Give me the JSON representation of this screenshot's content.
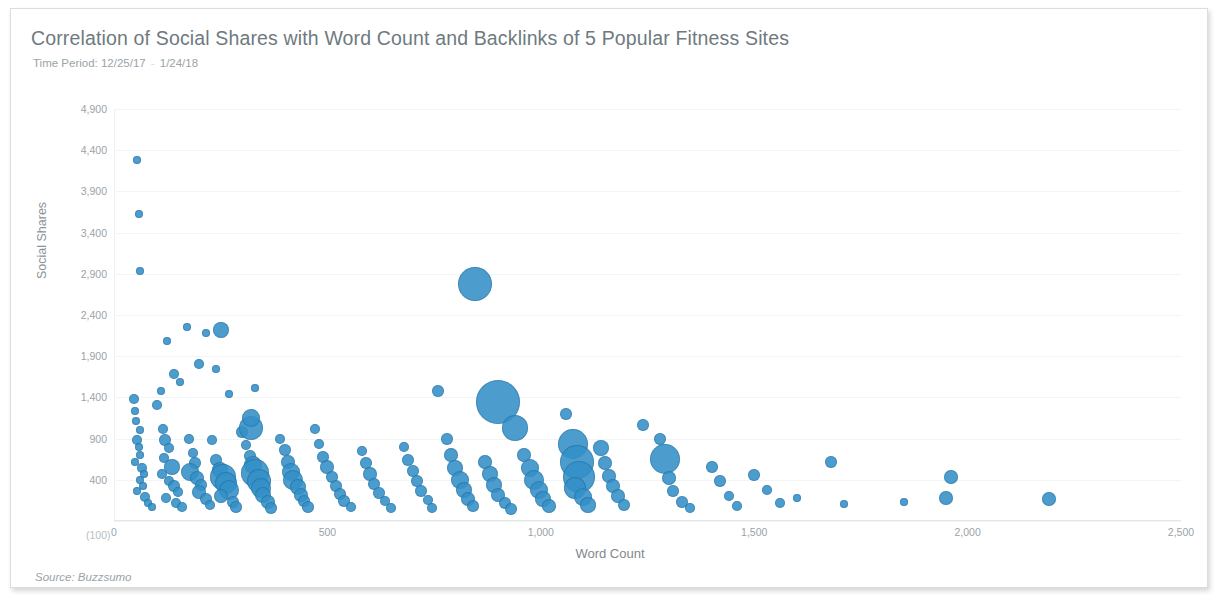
{
  "header": {
    "title": "Correlation of Social Shares with Word Count and Backlinks of 5 Popular Fitness Sites",
    "subtitle_prefix": "Time Period:",
    "start_date": "12/25/17",
    "end_date": "1/24/18",
    "separator": "-"
  },
  "footer": {
    "source": "Source: Buzzsumo"
  },
  "style": {
    "bubble_color": "#3490c8",
    "title_color": "#6e7a80",
    "label_color": "#9aa3a8",
    "grid_color": "#f2f4f5",
    "border_color": "#dddddd"
  },
  "chart_data": {
    "type": "scatter",
    "title": "Correlation of Social Shares with Word Count and Backlinks of 5 Popular Fitness Sites",
    "subtitle": "Time Period: 12/25/17 - 1/24/18",
    "xlabel": "Word Count",
    "ylabel": "Social Shares",
    "source": "Source: Buzzsumo",
    "grid": true,
    "legend": "none",
    "bubble_size_encodes": "Backlinks",
    "xlim": [
      0,
      2500
    ],
    "ylim": [
      -100,
      4900
    ],
    "xticks": [
      0,
      500,
      1000,
      1500,
      2000,
      2500
    ],
    "xtick_labels": [
      "0",
      "500",
      "1,000",
      "1,500",
      "2,000",
      "2,500"
    ],
    "yticks": [
      -100,
      400,
      900,
      1400,
      1900,
      2400,
      2900,
      3400,
      3900,
      4400,
      4900
    ],
    "ytick_labels": [
      "(100)",
      "400",
      "900",
      "1,400",
      "1,900",
      "2,400",
      "2,900",
      "3,400",
      "3,900",
      "4,400",
      "4,900"
    ],
    "points": [
      {
        "x": 55,
        "y": 4280,
        "r": 4
      },
      {
        "x": 58,
        "y": 3620,
        "r": 4
      },
      {
        "x": 60,
        "y": 2930,
        "r": 4
      },
      {
        "x": 48,
        "y": 1380,
        "r": 5
      },
      {
        "x": 50,
        "y": 1230,
        "r": 4
      },
      {
        "x": 52,
        "y": 1110,
        "r": 4
      },
      {
        "x": 60,
        "y": 1000,
        "r": 4
      },
      {
        "x": 55,
        "y": 880,
        "r": 5
      },
      {
        "x": 58,
        "y": 800,
        "r": 4
      },
      {
        "x": 62,
        "y": 700,
        "r": 4
      },
      {
        "x": 50,
        "y": 620,
        "r": 4
      },
      {
        "x": 65,
        "y": 540,
        "r": 5
      },
      {
        "x": 70,
        "y": 470,
        "r": 4
      },
      {
        "x": 60,
        "y": 400,
        "r": 4
      },
      {
        "x": 68,
        "y": 330,
        "r": 4
      },
      {
        "x": 55,
        "y": 260,
        "r": 4
      },
      {
        "x": 72,
        "y": 190,
        "r": 5
      },
      {
        "x": 80,
        "y": 120,
        "r": 4
      },
      {
        "x": 90,
        "y": 70,
        "r": 4
      },
      {
        "x": 100,
        "y": 1310,
        "r": 5
      },
      {
        "x": 110,
        "y": 1480,
        "r": 4
      },
      {
        "x": 125,
        "y": 2090,
        "r": 4
      },
      {
        "x": 140,
        "y": 1680,
        "r": 5
      },
      {
        "x": 155,
        "y": 1590,
        "r": 4
      },
      {
        "x": 170,
        "y": 2260,
        "r": 4
      },
      {
        "x": 200,
        "y": 1810,
        "r": 5
      },
      {
        "x": 215,
        "y": 2180,
        "r": 4
      },
      {
        "x": 240,
        "y": 1740,
        "r": 4
      },
      {
        "x": 250,
        "y": 2220,
        "r": 8
      },
      {
        "x": 270,
        "y": 1440,
        "r": 4
      },
      {
        "x": 330,
        "y": 1520,
        "r": 4
      },
      {
        "x": 115,
        "y": 1020,
        "r": 5
      },
      {
        "x": 120,
        "y": 880,
        "r": 6
      },
      {
        "x": 130,
        "y": 780,
        "r": 5
      },
      {
        "x": 118,
        "y": 660,
        "r": 5
      },
      {
        "x": 135,
        "y": 560,
        "r": 8
      },
      {
        "x": 112,
        "y": 470,
        "r": 5
      },
      {
        "x": 128,
        "y": 390,
        "r": 5
      },
      {
        "x": 140,
        "y": 320,
        "r": 6
      },
      {
        "x": 150,
        "y": 250,
        "r": 5
      },
      {
        "x": 122,
        "y": 180,
        "r": 5
      },
      {
        "x": 145,
        "y": 120,
        "r": 5
      },
      {
        "x": 160,
        "y": 70,
        "r": 5
      },
      {
        "x": 175,
        "y": 900,
        "r": 5
      },
      {
        "x": 185,
        "y": 720,
        "r": 5
      },
      {
        "x": 190,
        "y": 600,
        "r": 6
      },
      {
        "x": 178,
        "y": 500,
        "r": 9
      },
      {
        "x": 195,
        "y": 420,
        "r": 7
      },
      {
        "x": 205,
        "y": 340,
        "r": 6
      },
      {
        "x": 200,
        "y": 250,
        "r": 7
      },
      {
        "x": 215,
        "y": 170,
        "r": 6
      },
      {
        "x": 225,
        "y": 90,
        "r": 5
      },
      {
        "x": 230,
        "y": 880,
        "r": 5
      },
      {
        "x": 240,
        "y": 640,
        "r": 6
      },
      {
        "x": 248,
        "y": 520,
        "r": 8
      },
      {
        "x": 255,
        "y": 440,
        "r": 13
      },
      {
        "x": 262,
        "y": 360,
        "r": 11
      },
      {
        "x": 270,
        "y": 280,
        "r": 10
      },
      {
        "x": 250,
        "y": 200,
        "r": 7
      },
      {
        "x": 278,
        "y": 130,
        "r": 6
      },
      {
        "x": 285,
        "y": 70,
        "r": 6
      },
      {
        "x": 300,
        "y": 980,
        "r": 6
      },
      {
        "x": 310,
        "y": 820,
        "r": 5
      },
      {
        "x": 318,
        "y": 690,
        "r": 6
      },
      {
        "x": 325,
        "y": 580,
        "r": 9
      },
      {
        "x": 330,
        "y": 480,
        "r": 14
      },
      {
        "x": 340,
        "y": 390,
        "r": 12
      },
      {
        "x": 345,
        "y": 300,
        "r": 10
      },
      {
        "x": 350,
        "y": 210,
        "r": 8
      },
      {
        "x": 360,
        "y": 130,
        "r": 7
      },
      {
        "x": 368,
        "y": 60,
        "r": 6
      },
      {
        "x": 320,
        "y": 1030,
        "r": 12
      },
      {
        "x": 322,
        "y": 1150,
        "r": 9
      },
      {
        "x": 390,
        "y": 900,
        "r": 5
      },
      {
        "x": 400,
        "y": 760,
        "r": 6
      },
      {
        "x": 408,
        "y": 620,
        "r": 7
      },
      {
        "x": 415,
        "y": 500,
        "r": 9
      },
      {
        "x": 420,
        "y": 400,
        "r": 10
      },
      {
        "x": 430,
        "y": 310,
        "r": 8
      },
      {
        "x": 438,
        "y": 220,
        "r": 7
      },
      {
        "x": 445,
        "y": 140,
        "r": 6
      },
      {
        "x": 455,
        "y": 70,
        "r": 6
      },
      {
        "x": 470,
        "y": 1020,
        "r": 5
      },
      {
        "x": 480,
        "y": 830,
        "r": 5
      },
      {
        "x": 490,
        "y": 680,
        "r": 6
      },
      {
        "x": 500,
        "y": 560,
        "r": 7
      },
      {
        "x": 510,
        "y": 440,
        "r": 6
      },
      {
        "x": 520,
        "y": 330,
        "r": 6
      },
      {
        "x": 530,
        "y": 230,
        "r": 6
      },
      {
        "x": 540,
        "y": 140,
        "r": 6
      },
      {
        "x": 555,
        "y": 70,
        "r": 5
      },
      {
        "x": 580,
        "y": 750,
        "r": 5
      },
      {
        "x": 590,
        "y": 600,
        "r": 6
      },
      {
        "x": 600,
        "y": 470,
        "r": 7
      },
      {
        "x": 610,
        "y": 350,
        "r": 6
      },
      {
        "x": 620,
        "y": 240,
        "r": 6
      },
      {
        "x": 635,
        "y": 140,
        "r": 5
      },
      {
        "x": 650,
        "y": 60,
        "r": 5
      },
      {
        "x": 680,
        "y": 800,
        "r": 5
      },
      {
        "x": 690,
        "y": 640,
        "r": 6
      },
      {
        "x": 700,
        "y": 510,
        "r": 6
      },
      {
        "x": 710,
        "y": 380,
        "r": 6
      },
      {
        "x": 720,
        "y": 260,
        "r": 6
      },
      {
        "x": 735,
        "y": 150,
        "r": 5
      },
      {
        "x": 745,
        "y": 60,
        "r": 5
      },
      {
        "x": 760,
        "y": 1480,
        "r": 6
      },
      {
        "x": 780,
        "y": 900,
        "r": 6
      },
      {
        "x": 790,
        "y": 700,
        "r": 7
      },
      {
        "x": 800,
        "y": 540,
        "r": 8
      },
      {
        "x": 810,
        "y": 400,
        "r": 9
      },
      {
        "x": 820,
        "y": 280,
        "r": 8
      },
      {
        "x": 830,
        "y": 170,
        "r": 7
      },
      {
        "x": 840,
        "y": 80,
        "r": 6
      },
      {
        "x": 845,
        "y": 2780,
        "r": 17
      },
      {
        "x": 900,
        "y": 1350,
        "r": 22
      },
      {
        "x": 940,
        "y": 1030,
        "r": 13
      },
      {
        "x": 870,
        "y": 620,
        "r": 7
      },
      {
        "x": 880,
        "y": 470,
        "r": 8
      },
      {
        "x": 890,
        "y": 340,
        "r": 8
      },
      {
        "x": 900,
        "y": 220,
        "r": 7
      },
      {
        "x": 915,
        "y": 120,
        "r": 6
      },
      {
        "x": 930,
        "y": 50,
        "r": 6
      },
      {
        "x": 960,
        "y": 700,
        "r": 7
      },
      {
        "x": 975,
        "y": 540,
        "r": 9
      },
      {
        "x": 985,
        "y": 400,
        "r": 10
      },
      {
        "x": 995,
        "y": 280,
        "r": 9
      },
      {
        "x": 1005,
        "y": 170,
        "r": 8
      },
      {
        "x": 1020,
        "y": 80,
        "r": 7
      },
      {
        "x": 1060,
        "y": 1200,
        "r": 6
      },
      {
        "x": 1075,
        "y": 840,
        "r": 15
      },
      {
        "x": 1085,
        "y": 620,
        "r": 17
      },
      {
        "x": 1090,
        "y": 440,
        "r": 16
      },
      {
        "x": 1080,
        "y": 300,
        "r": 11
      },
      {
        "x": 1100,
        "y": 190,
        "r": 9
      },
      {
        "x": 1110,
        "y": 90,
        "r": 8
      },
      {
        "x": 1140,
        "y": 780,
        "r": 8
      },
      {
        "x": 1150,
        "y": 600,
        "r": 7
      },
      {
        "x": 1160,
        "y": 450,
        "r": 7
      },
      {
        "x": 1170,
        "y": 320,
        "r": 7
      },
      {
        "x": 1180,
        "y": 200,
        "r": 7
      },
      {
        "x": 1195,
        "y": 100,
        "r": 6
      },
      {
        "x": 1240,
        "y": 1060,
        "r": 6
      },
      {
        "x": 1280,
        "y": 900,
        "r": 6
      },
      {
        "x": 1290,
        "y": 650,
        "r": 15
      },
      {
        "x": 1300,
        "y": 420,
        "r": 7
      },
      {
        "x": 1310,
        "y": 260,
        "r": 6
      },
      {
        "x": 1330,
        "y": 130,
        "r": 6
      },
      {
        "x": 1350,
        "y": 60,
        "r": 5
      },
      {
        "x": 1400,
        "y": 560,
        "r": 6
      },
      {
        "x": 1420,
        "y": 380,
        "r": 6
      },
      {
        "x": 1440,
        "y": 200,
        "r": 5
      },
      {
        "x": 1460,
        "y": 80,
        "r": 5
      },
      {
        "x": 1500,
        "y": 460,
        "r": 6
      },
      {
        "x": 1530,
        "y": 280,
        "r": 5
      },
      {
        "x": 1560,
        "y": 120,
        "r": 5
      },
      {
        "x": 1600,
        "y": 180,
        "r": 4
      },
      {
        "x": 1680,
        "y": 620,
        "r": 6
      },
      {
        "x": 1710,
        "y": 110,
        "r": 4
      },
      {
        "x": 1850,
        "y": 130,
        "r": 4
      },
      {
        "x": 1960,
        "y": 440,
        "r": 7
      },
      {
        "x": 1950,
        "y": 180,
        "r": 7
      },
      {
        "x": 2190,
        "y": 170,
        "r": 7
      }
    ]
  }
}
